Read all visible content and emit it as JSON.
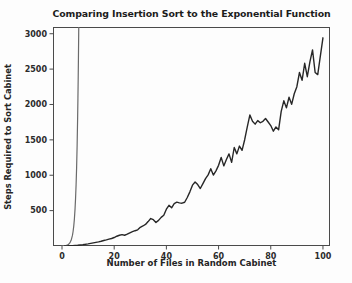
{
  "chart_data": {
    "type": "line",
    "title": "Comparing Insertion Sort to the Exponential Function",
    "xlabel": "Number of Files in Random Cabinet",
    "ylabel": "Steps Required to Sort Cabinet",
    "xlim": [
      -3.45,
      102.7
    ],
    "ylim": [
      0,
      3095
    ],
    "x_ticks": [
      0,
      20,
      40,
      60,
      80,
      100
    ],
    "y_ticks": [
      500,
      1000,
      1500,
      2000,
      2500,
      3000
    ],
    "grid": false,
    "legend": null,
    "axis_color": "#4a4a4a",
    "tick_label_color": "#2b2b2b",
    "series": [
      {
        "name": "Exponential Function",
        "color": "#6a6a6a",
        "width": 1.2,
        "x": [
          0,
          0.5,
          1,
          1.5,
          2,
          2.5,
          3,
          3.5,
          4,
          4.25,
          4.5,
          4.75,
          5,
          5.2,
          5.4,
          5.6,
          5.8,
          6,
          6.1,
          6.2,
          6.3,
          6.4,
          6.5
        ],
        "y": [
          1,
          2,
          4,
          7,
          12,
          23,
          43,
          80,
          150,
          205,
          281,
          384,
          525,
          674,
          866,
          1112,
          1428,
          1838,
          2080,
          2353,
          2662,
          3012,
          3410
        ]
      },
      {
        "name": "Insertion Sort",
        "color": "#272727",
        "width": 1.4,
        "x_range": [
          1,
          100
        ],
        "y": [
          0,
          1,
          3,
          5,
          8,
          11,
          15,
          19,
          24,
          30,
          37,
          44,
          51,
          58,
          67,
          77,
          86,
          97,
          106,
          120,
          138,
          152,
          160,
          152,
          168,
          186,
          202,
          216,
          228,
          264,
          283,
          305,
          345,
          388,
          372,
          332,
          362,
          405,
          435,
          520,
          575,
          540,
          600,
          620,
          610,
          605,
          618,
          685,
          765,
          860,
          905,
          868,
          812,
          882,
          952,
          1005,
          1092,
          1002,
          1062,
          1140,
          1252,
          1132,
          1222,
          1302,
          1182,
          1392,
          1302,
          1412,
          1352,
          1502,
          1682,
          1852,
          1762,
          1722,
          1772,
          1742,
          1762,
          1802,
          1752,
          1702,
          1622,
          1682,
          1642,
          1902,
          2052,
          1952,
          2102,
          2002,
          2152,
          2252,
          2452,
          2342,
          2582,
          2392,
          2602,
          2772,
          2452,
          2422,
          2682,
          2942
        ]
      }
    ]
  }
}
